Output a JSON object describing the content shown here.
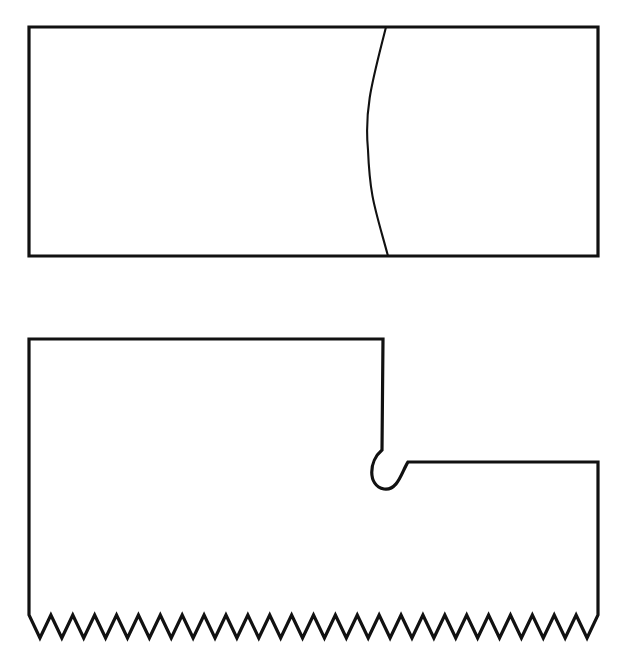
{
  "figure": {
    "title": "Two outline shapes on white background",
    "background_color": "#ffffff",
    "stroke_color": "#111111",
    "canvas": {
      "width": 624,
      "height": 660
    }
  },
  "shapes": [
    {
      "id": "upper-rectangle",
      "name": "Rectangle divided by a vertical arc",
      "type": "rectangle-with-arc",
      "stroke_width_outline": 3.2,
      "stroke_width_inner": 2.1,
      "bounds": {
        "left": 29,
        "top": 27,
        "right": 598,
        "bottom": 256,
        "width": 569,
        "height": 229
      },
      "arc": {
        "name": "interior-vertical-arc",
        "top_point": {
          "x": 386,
          "y": 27
        },
        "bottom_point": {
          "x": 388,
          "y": 256
        },
        "apex_point": {
          "x": 368,
          "y": 150
        },
        "bulge_direction": "left"
      }
    },
    {
      "id": "lower-notched-shape",
      "name": "Stepped polygon with rounded notch and serrated bottom edge",
      "type": "polygon-with-notch-and-zigzag",
      "stroke_width_outline": 3.2,
      "bounds": {
        "left": 29,
        "top": 339,
        "right": 598,
        "bottom": 638,
        "width": 569,
        "height": 299
      },
      "step": {
        "name": "upper-step-top-right-corner",
        "x": 383,
        "y": 339,
        "drop_to_y": 450
      },
      "notch": {
        "name": "rounded-u-notch",
        "left_wall_x": 382,
        "curve_top_y": 450,
        "curve_bottom_y": 489,
        "right_shoulder_x": 408,
        "shelf_y": 462,
        "radius": 13
      },
      "right_edge": {
        "x": 598,
        "top_y": 462,
        "bottom_y": 615
      },
      "zigzag": {
        "name": "serrated-bottom-edge",
        "start_x": 29,
        "end_x": 598,
        "peak_y": 615,
        "valley_y": 638,
        "tooth_count": 26,
        "tooth_width": 21.9,
        "amplitude": 23
      }
    }
  ],
  "accessibility": {
    "upper_shape_label": "Upper rectangle with curved dividing line",
    "lower_shape_label": "Lower shape with rounded notch and zigzag bottom"
  }
}
